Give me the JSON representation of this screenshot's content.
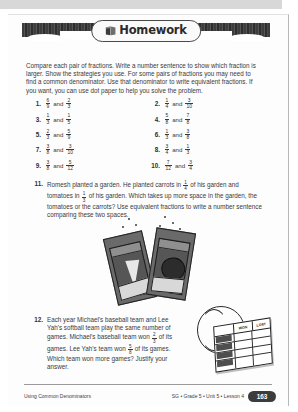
{
  "banner": {
    "title": "Homework",
    "icon": "book-icon"
  },
  "intro": "Compare each pair of fractions. Write a number sentence to show which fraction is larger. Show the strategies you use. For some pairs of fractions you may need to find a common denominator. Use that denominator to write equivalent fractions. If you want, you can use dot paper to help you solve the problem.",
  "connector": "and",
  "problems": [
    {
      "number": "1.",
      "left_num": "6",
      "left_den": "9",
      "right_num": "2",
      "right_den": "3"
    },
    {
      "number": "2.",
      "left_num": "1",
      "left_den": "4",
      "right_num": "3",
      "right_den": "10"
    },
    {
      "number": "3.",
      "left_num": "1",
      "left_den": "3",
      "right_num": "1",
      "right_den": "5"
    },
    {
      "number": "4.",
      "left_num": "5",
      "left_den": "8",
      "right_num": "7",
      "right_den": "8"
    },
    {
      "number": "5.",
      "left_num": "2",
      "left_den": "3",
      "right_num": "5",
      "right_den": "9"
    },
    {
      "number": "6.",
      "left_num": "1",
      "left_den": "3",
      "right_num": "3",
      "right_den": "8"
    },
    {
      "number": "7.",
      "left_num": "3",
      "left_den": "8",
      "right_num": "3",
      "right_den": "10"
    },
    {
      "number": "8.",
      "left_num": "3",
      "left_den": "4",
      "right_num": "1",
      "right_den": "3"
    },
    {
      "number": "9.",
      "left_num": "3",
      "left_den": "8",
      "right_num": "5",
      "right_den": "12"
    },
    {
      "number": "10.",
      "left_num": "7",
      "left_den": "12",
      "right_num": "3",
      "right_den": "4"
    }
  ],
  "problem11": {
    "number": "11.",
    "part1": "Romesh planted a garden. He planted carrots in",
    "frac1_num": "1",
    "frac1_den": "4",
    "part2": "of his garden and tomatoes in",
    "frac2_num": "1",
    "frac2_den": "3",
    "part3": "of his garden. Which takes up more space in the garden, the tomatoes or the carrots? Use equivalent fractions to write a number sentence comparing these two spaces."
  },
  "problem12": {
    "number": "12.",
    "part1": "Each year Michael's baseball team and Lee Yah's softball team play the same number of games. Michael's baseball team won",
    "frac1_num": "2",
    "frac1_den": "3",
    "part2": "of its games. Lee Yah's team won",
    "frac2_num": "5",
    "frac2_den": "8",
    "part3": "of its games. Which team won more games? Justify your answer."
  },
  "illustrations": {
    "seed_packets": "seed-packets-illustration",
    "baseball": "baseball-standings-illustration",
    "chart_col_won": "WON",
    "chart_col_lost": "LOST"
  },
  "footer": {
    "left": "Using Common Denominators",
    "meta": "SG • Grade 5 • Unit 5 • Lesson 4",
    "page": "163"
  }
}
